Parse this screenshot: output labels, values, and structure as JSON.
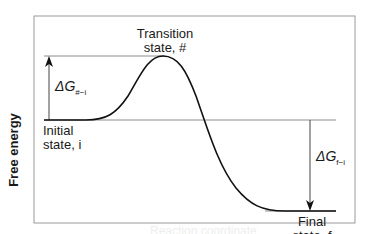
{
  "diagram": {
    "type": "reaction-energy-profile",
    "y_axis_label": "Free energy",
    "x_axis_label": "Reaction coordinate",
    "states": {
      "transition": {
        "line1": "Transition",
        "line2": "state, #"
      },
      "initial": {
        "line1": "Initial",
        "line2": "state, i"
      },
      "final": {
        "line1": "Final",
        "line2": "state, f"
      }
    },
    "deltas": {
      "activation": {
        "symbol": "ΔG",
        "subscript": "#−i"
      },
      "reaction": {
        "symbol": "ΔG",
        "subscript": "f−i"
      }
    },
    "colors": {
      "curve": "#111111",
      "frame": "#9a9a9a",
      "levels": "#8c8c8c",
      "arrows": "#444444",
      "text": "#1a1a1a"
    }
  }
}
